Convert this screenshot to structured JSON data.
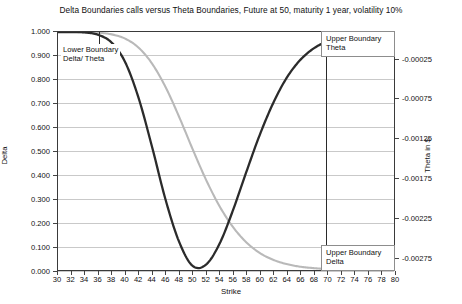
{
  "chart_data": {
    "type": "line",
    "title": "Delta Boundaries calls versus Theta Boundaries, Future at 50, maturity 1 year, volatility 10%",
    "xlabel": "Strike",
    "ylabel": "Delta",
    "y2label": "Theta in $",
    "xlim": [
      30,
      80
    ],
    "ylim": [
      0.0,
      1.0
    ],
    "y2lim": [
      -0.003,
      0.0
    ],
    "grid": true,
    "legend": "none",
    "xticks": [
      30,
      32,
      34,
      36,
      38,
      40,
      42,
      44,
      46,
      48,
      50,
      52,
      54,
      56,
      58,
      60,
      62,
      64,
      66,
      68,
      70,
      72,
      74,
      76,
      78,
      80
    ],
    "xtick_labels": [
      "30",
      "32",
      "34",
      "36",
      "38",
      "40",
      "42",
      "44",
      "46",
      "48",
      "50",
      "52",
      "54",
      "56",
      "58",
      "60",
      "62",
      "64",
      "66",
      "68",
      "70",
      "72",
      "74",
      "76",
      "78",
      "80"
    ],
    "yticks": [
      0.0,
      0.1,
      0.2,
      0.3,
      0.4,
      0.5,
      0.6,
      0.7,
      0.8,
      0.9,
      1.0
    ],
    "ytick_labels": [
      "0.000",
      "0.100",
      "0.200",
      "0.300",
      "0.400",
      "0.500",
      "0.600",
      "0.700",
      "0.800",
      "0.900",
      "1.000"
    ],
    "y2ticks": [
      -0.00025,
      -0.00075,
      -0.00125,
      -0.00175,
      -0.00225,
      -0.00275
    ],
    "y2tick_labels": [
      "-0.00025",
      "-0.00075",
      "-0.00125",
      "-0.00175",
      "-0.00225",
      "-0.00275"
    ],
    "series": [
      {
        "name": "Delta",
        "axis": "left",
        "color": "#b9b9b9",
        "x": [
          30,
          32,
          34,
          36,
          38,
          40,
          42,
          44,
          46,
          48,
          50,
          52,
          54,
          56,
          58,
          60,
          62,
          64,
          66,
          68,
          70,
          72,
          74,
          76,
          78,
          80
        ],
        "values": [
          1.0,
          1.0,
          0.999,
          0.997,
          0.99,
          0.972,
          0.934,
          0.867,
          0.769,
          0.645,
          0.51,
          0.381,
          0.27,
          0.182,
          0.117,
          0.072,
          0.043,
          0.025,
          0.014,
          0.008,
          0.004,
          0.002,
          0.001,
          0.001,
          0.0,
          0.0
        ]
      },
      {
        "name": "Theta",
        "axis": "right",
        "color": "#2b2b2b",
        "x": [
          30,
          32,
          34,
          36,
          38,
          40,
          42,
          44,
          46,
          48,
          50,
          52,
          54,
          56,
          58,
          60,
          62,
          64,
          66,
          68,
          70,
          72,
          74,
          76,
          78,
          80
        ],
        "values": [
          1.0,
          1.0,
          0.998,
          0.988,
          0.955,
          0.873,
          0.722,
          0.517,
          0.296,
          0.12,
          0.018,
          0.022,
          0.108,
          0.248,
          0.41,
          0.566,
          0.7,
          0.806,
          0.881,
          0.93,
          0.96,
          0.978,
          0.988,
          0.994,
          0.997,
          0.999
        ]
      }
    ],
    "annotations": [
      {
        "name": "lower-boundary",
        "text_line1": "Lower Boundary",
        "text_line2": "Delta/ Theta",
        "strike": 36
      },
      {
        "name": "upper-boundary-theta",
        "text_line1": "Upper Boundary",
        "text_line2": "Theta",
        "strike": 69
      },
      {
        "name": "upper-boundary-delta",
        "text_line1": "Upper Boundary",
        "text_line2": "Delta",
        "strike": 69
      }
    ]
  }
}
